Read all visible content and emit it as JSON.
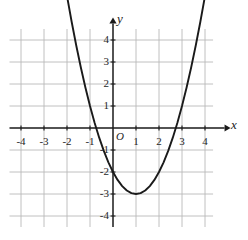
{
  "figure": {
    "background_color": "#ffffff",
    "axis_color": "#1a1a1a",
    "grid_color": "#b9b9b9",
    "curve_color": "#1a1a1a",
    "x_axis_label": "x",
    "y_axis_label": "y",
    "origin_label": "O"
  },
  "chart_data": {
    "type": "line",
    "title": "",
    "subtitle": "",
    "xlabel": "x",
    "ylabel": "y",
    "xlim": [
      -4.6,
      4.4
    ],
    "ylim": [
      -4.6,
      4.6
    ],
    "grid": true,
    "grid_step_x": 1,
    "grid_step_y": 1,
    "legend": "none",
    "x_tick_labels": [
      "-4",
      "-3",
      "-2",
      "-1",
      "1",
      "2",
      "3",
      "4"
    ],
    "x_ticks": [
      -4,
      -3,
      -2,
      -1,
      1,
      2,
      3,
      4
    ],
    "y_tick_labels": [
      "4",
      "3",
      "2",
      "1",
      "-1",
      "-2",
      "-3",
      "-4"
    ],
    "y_ticks": [
      4,
      3,
      2,
      1,
      -1,
      -2,
      -3,
      -4
    ],
    "origin_tick_label": "O",
    "equation": "y = x^2 - 2x - 2",
    "vertex": [
      1,
      -3
    ],
    "x_intercepts": [
      -0.73,
      2.73
    ],
    "y_intercept": -2,
    "x_domain_drawn": [
      -2.15,
      4.1
    ],
    "series": [
      {
        "name": "y = x^2 - 2x - 2",
        "color": "#1a1a1a",
        "x": [
          -2.15,
          -2.0,
          -1.8,
          -1.6,
          -1.4,
          -1.2,
          -1.0,
          -0.8,
          -0.6,
          -0.4,
          -0.2,
          0.0,
          0.2,
          0.4,
          0.6,
          0.8,
          1.0,
          1.2,
          1.4,
          1.6,
          1.8,
          2.0,
          2.2,
          2.4,
          2.6,
          2.8,
          3.0,
          3.2,
          3.4,
          3.6,
          3.8,
          4.0,
          4.1
        ],
        "y": [
          6.92,
          6.0,
          4.84,
          3.76,
          2.76,
          1.84,
          1.0,
          0.24,
          -0.44,
          -1.04,
          -1.56,
          -2.0,
          -2.36,
          -2.64,
          -2.84,
          -2.96,
          -3.0,
          -2.96,
          -2.84,
          -2.64,
          -2.36,
          -2.0,
          -1.56,
          -1.04,
          -0.44,
          0.24,
          1.0,
          1.84,
          2.76,
          3.76,
          4.84,
          6.0,
          6.61
        ]
      }
    ]
  }
}
